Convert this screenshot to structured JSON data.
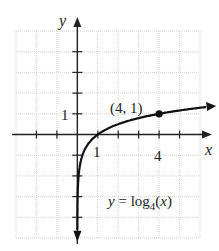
{
  "chart_data": {
    "type": "line",
    "title": "",
    "function_label": "y = log4(x)",
    "function_label_parts": {
      "pre": "y = log",
      "sub": "4",
      "post": "(x)"
    },
    "xlabel": "x",
    "ylabel": "y",
    "xlim": [
      -3,
      6
    ],
    "ylim": [
      -5,
      5
    ],
    "grid": true,
    "x_tick_labels": [
      {
        "value": 1,
        "label": "1"
      },
      {
        "value": 4,
        "label": "4"
      }
    ],
    "y_tick_labels": [
      {
        "value": 1,
        "label": "1"
      }
    ],
    "series": [
      {
        "name": "y = log4(x)",
        "x": [
          0.25,
          0.5,
          1,
          2,
          4,
          6
        ],
        "values": [
          -1,
          -0.5,
          0,
          0.5,
          1,
          1.29
        ]
      }
    ],
    "annotations": [
      {
        "x": 4,
        "y": 1,
        "label": "(4, 1)",
        "marker": "filled-circle"
      }
    ],
    "colors": {
      "curve": "#111111",
      "grid": "#c8c8c8",
      "axis": "#222222"
    }
  }
}
